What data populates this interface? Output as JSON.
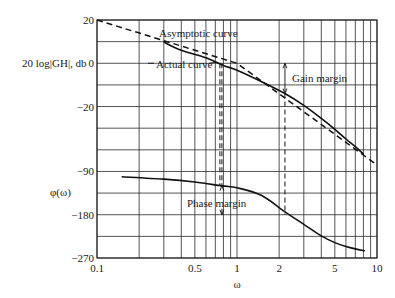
{
  "chart_data": {
    "type": "line",
    "title": "",
    "xlabel": "ω",
    "xscale": "log",
    "xlim": [
      0.1,
      10
    ],
    "x_ticks": [
      {
        "value": 0.1,
        "label": "0.1"
      },
      {
        "value": 0.5,
        "label": "0.5"
      },
      {
        "value": 1,
        "label": "1"
      },
      {
        "value": 2,
        "label": "2"
      },
      {
        "value": 5,
        "label": "5"
      },
      {
        "value": 10,
        "label": "10"
      }
    ],
    "x_gridlines": [
      0.1,
      0.2,
      0.3,
      0.4,
      0.5,
      0.6,
      0.7,
      0.8,
      0.9,
      1,
      2,
      3,
      4,
      5,
      6,
      7,
      8,
      9,
      10
    ],
    "grid": true,
    "magnitude_axis": {
      "label": "20 log|GH|, db",
      "range": [
        -30,
        20
      ],
      "ticks": [
        {
          "value": 20,
          "label": "20"
        },
        {
          "value": 0,
          "label": "0"
        },
        {
          "value": -20,
          "label": "−20"
        }
      ]
    },
    "phase_axis": {
      "label": "φ(ω)",
      "range": [
        -270,
        -45
      ],
      "ticks": [
        {
          "value": -90,
          "label": "−90"
        },
        {
          "value": -180,
          "label": "−180"
        },
        {
          "value": -270,
          "label": "−270"
        }
      ]
    },
    "series": [
      {
        "name": "Asymptotic curve",
        "axis": "magnitude",
        "style": "dashed",
        "points": [
          [
            0.1,
            20
          ],
          [
            1,
            0
          ],
          [
            10,
            -47
          ]
        ]
      },
      {
        "name": "Actual curve",
        "axis": "magnitude",
        "style": "solid",
        "points": [
          [
            0.4,
            6
          ],
          [
            0.6,
            2.5
          ],
          [
            0.8,
            -1
          ],
          [
            1,
            -3.2
          ],
          [
            1.5,
            -8.5
          ],
          [
            2.2,
            -14
          ],
          [
            3,
            -19.5
          ],
          [
            4,
            -25.5
          ],
          [
            5,
            -30.5
          ],
          [
            6,
            -35
          ],
          [
            7,
            -38.5
          ],
          [
            8,
            -42
          ]
        ]
      },
      {
        "name": "Phase",
        "axis": "phase",
        "style": "solid",
        "points": [
          [
            0.15,
            -101
          ],
          [
            0.3,
            -106
          ],
          [
            0.5,
            -112
          ],
          [
            0.78,
            -120
          ],
          [
            1,
            -124
          ],
          [
            1.5,
            -140
          ],
          [
            2.2,
            -174
          ],
          [
            3,
            -200
          ],
          [
            4,
            -224
          ],
          [
            5,
            -238
          ],
          [
            6,
            -246
          ],
          [
            7,
            -251
          ],
          [
            8.2,
            -255
          ]
        ]
      }
    ],
    "annotations": {
      "asymptotic_label": "Asymptotic curve",
      "actual_label": "Actual curve",
      "gain_margin_label": "Gain margin",
      "phase_margin_label": "Phase margin",
      "gain_margin": {
        "omega": 2.2,
        "from_db": 0,
        "to_db": -14
      },
      "phase_margin": {
        "omega": 0.78,
        "from_deg": -120,
        "to_deg": -180
      }
    }
  }
}
